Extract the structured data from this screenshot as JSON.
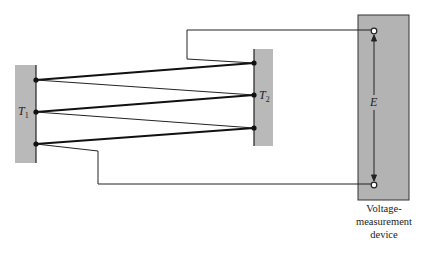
{
  "diagram": {
    "type": "thermocouple-series-circuit",
    "left_block": {
      "label": "T",
      "subscript": "1",
      "fill": "#b9b9b9"
    },
    "right_block": {
      "label": "T",
      "subscript": "2",
      "fill": "#b9b9b9"
    },
    "device": {
      "fill": "#b3b3b3",
      "emf_label": "E",
      "caption": [
        "Voltage-",
        "measurement",
        "device"
      ]
    },
    "junctions": {
      "left": 3,
      "right": 3
    }
  }
}
